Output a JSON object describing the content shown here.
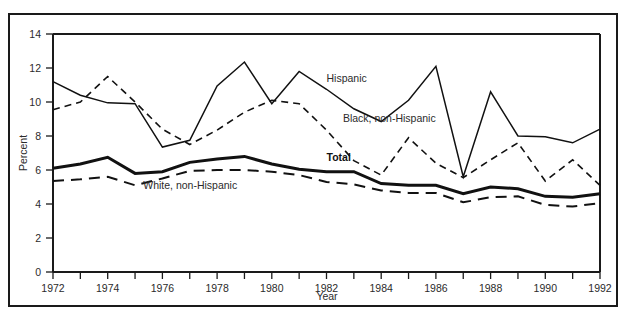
{
  "figure": {
    "background_color": "#ffffff",
    "frame_color": "#1a1a1a",
    "line_color": "#111111"
  },
  "chart_data": {
    "type": "line",
    "title": "",
    "xlabel": "Year",
    "ylabel": "Percent",
    "xlim": [
      1972,
      1992
    ],
    "ylim": [
      0,
      14
    ],
    "ytick_step": 2,
    "yticks": [
      0,
      2,
      4,
      6,
      8,
      10,
      12,
      14
    ],
    "ytick_labels": [
      "0",
      "2",
      "4",
      "6",
      "8",
      "10",
      "12",
      "14"
    ],
    "x": [
      1972,
      1973,
      1974,
      1975,
      1976,
      1977,
      1978,
      1979,
      1980,
      1981,
      1982,
      1983,
      1984,
      1985,
      1986,
      1987,
      1988,
      1989,
      1990,
      1991,
      1992
    ],
    "xtick_labels": [
      "1972",
      "",
      "1974",
      "",
      "1976",
      "",
      "1978",
      "",
      "1980",
      "",
      "1982",
      "",
      "1984",
      "",
      "1986",
      "",
      "1988",
      "",
      "1990",
      "",
      "1992"
    ],
    "xticks_minor_every": 1,
    "grid": false,
    "legend_position": "inline-annotations",
    "series": [
      {
        "name": "Hispanic",
        "style": "solid-thin",
        "label_x": 1982.0,
        "label_y": 11.2,
        "values": [
          11.2,
          10.4,
          9.95,
          9.9,
          7.35,
          7.75,
          10.95,
          12.35,
          9.9,
          11.8,
          10.75,
          9.6,
          8.85,
          10.1,
          12.1,
          5.6,
          10.6,
          8.0,
          7.95,
          7.6,
          8.4
        ]
      },
      {
        "name": "Black, non-Hispanic",
        "style": "dashed-dot",
        "label_x": 1982.6,
        "label_y": 8.8,
        "values": [
          9.55,
          10.0,
          11.5,
          10.0,
          8.4,
          7.5,
          8.35,
          9.4,
          10.1,
          9.9,
          8.35,
          6.55,
          5.7,
          7.9,
          6.4,
          5.55,
          6.6,
          7.6,
          5.35,
          6.6,
          5.1
        ]
      },
      {
        "name": "Total",
        "style": "solid-thick",
        "label_x": 1982.0,
        "label_y": 6.55,
        "values": [
          6.1,
          6.35,
          6.75,
          5.8,
          5.9,
          6.45,
          6.65,
          6.8,
          6.35,
          6.05,
          5.9,
          5.9,
          5.2,
          5.1,
          5.1,
          4.6,
          5.0,
          4.9,
          4.45,
          4.4,
          4.6
        ]
      },
      {
        "name": "White, non-Hispanic",
        "style": "dashed-long",
        "label_x": 1975.3,
        "label_y": 4.9,
        "values": [
          5.35,
          5.45,
          5.6,
          5.1,
          5.5,
          5.95,
          6.0,
          6.0,
          5.9,
          5.7,
          5.3,
          5.15,
          4.8,
          4.65,
          4.65,
          4.1,
          4.4,
          4.45,
          3.95,
          3.85,
          4.05
        ]
      }
    ]
  }
}
